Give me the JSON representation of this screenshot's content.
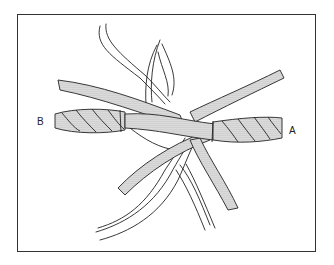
{
  "figure": {
    "labels": {
      "left_end": "B",
      "right_end": "A"
    },
    "colors": {
      "line": "#222222",
      "stipple": "#bdbdbd",
      "background": "#ffffff",
      "frame": "#333333"
    }
  }
}
